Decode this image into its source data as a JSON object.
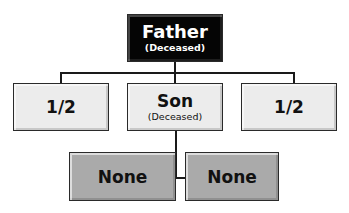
{
  "diagram": {
    "type": "inheritance-tree",
    "root": {
      "label": "Father",
      "note": "(Deceased)"
    },
    "children": [
      {
        "label": "1/2"
      },
      {
        "label": "Son",
        "note": "(Deceased)"
      },
      {
        "label": "1/2"
      }
    ],
    "grandchildren": [
      {
        "label": "None"
      },
      {
        "label": "None"
      }
    ]
  },
  "colors": {
    "root_fill": "#050505",
    "child_fill": "#ececec",
    "grandchild_fill": "#aaaaaa",
    "line": "#1a1a1a"
  }
}
